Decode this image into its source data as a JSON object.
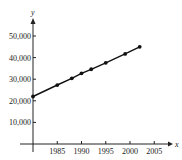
{
  "chart_data": {
    "type": "line",
    "title": "",
    "xlabel": "x",
    "ylabel": "y",
    "x": [
      1980,
      1985,
      1988,
      1990,
      1992,
      1995,
      1999,
      2002
    ],
    "values": [
      22000,
      27300,
      30400,
      32700,
      34600,
      37600,
      41700,
      45000
    ],
    "xticks": [
      1985,
      1990,
      1995,
      2000,
      2005
    ],
    "xtick_labels": [
      "1985",
      "1990",
      "1995",
      "2000",
      "2005"
    ],
    "yticks": [
      10000,
      20000,
      30000,
      40000,
      50000
    ],
    "ytick_labels": [
      "10,000",
      "20,000",
      "30,000",
      "40,000",
      "50,000"
    ],
    "xlim": [
      1980,
      2008
    ],
    "ylim": [
      0,
      55000
    ],
    "grid": false,
    "legend": null,
    "markers": true
  },
  "colors": {
    "line": "#111111",
    "axis": "#222222"
  }
}
